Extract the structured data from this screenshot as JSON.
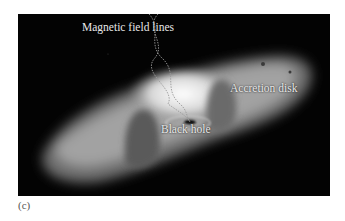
{
  "figure": {
    "panel_label": "(c)",
    "labels": {
      "magnetic_field_lines": "Magnetic field lines",
      "accretion_disk": "Accretion disk",
      "black_hole": "Black hole"
    },
    "colors": {
      "background": "#030303",
      "disk_bright": "#f2f2f2",
      "disk_mid": "#9a9a9a",
      "label_text": "#e8e8e8"
    }
  }
}
